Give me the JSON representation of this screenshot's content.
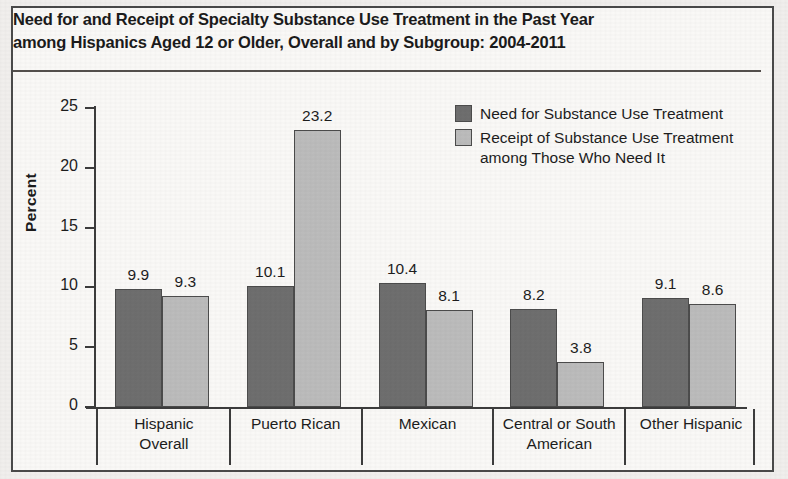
{
  "figure": {
    "title_lines": [
      "Need for and Receipt of Specialty Substance Use Treatment in the Past Year",
      "among Hispanics Aged 12 or Older, Overall and by Subgroup: 2004-2011"
    ]
  },
  "colors": {
    "need": "#6f6f6f",
    "receipt": "#bdbdbd",
    "axis": "#3d3d3d",
    "text": "#1d1d1d",
    "page": "#fbfaf8"
  },
  "chart_data": {
    "type": "bar",
    "title": "Need for and Receipt of Specialty Substance Use Treatment in the Past Year among Hispanics Aged 12 or Older, Overall and by Subgroup: 2004-2011",
    "xlabel": "",
    "ylabel": "Percent",
    "ylim": [
      0,
      25
    ],
    "yticks": [
      0,
      5,
      10,
      15,
      20,
      25
    ],
    "grid": false,
    "legend_position": "upper right",
    "categories": [
      "Hispanic Overall",
      "Puerto Rican",
      "Mexican",
      "Central or South American",
      "Other Hispanic"
    ],
    "category_lines": [
      [
        "Hispanic",
        "Overall"
      ],
      [
        "Puerto Rican"
      ],
      [
        "Mexican"
      ],
      [
        "Central or South",
        "American"
      ],
      [
        "Other Hispanic"
      ]
    ],
    "series": [
      {
        "name": "Need for Substance Use Treatment",
        "color": "#6f6f6f",
        "values": [
          9.9,
          10.1,
          10.4,
          8.2,
          9.1
        ],
        "labels": [
          "9.9",
          "10.1",
          "10.4",
          "8.2",
          "9.1"
        ]
      },
      {
        "name": "Receipt of Substance Use Treatment among Those Who Need It",
        "color": "#bdbdbd",
        "values": [
          9.3,
          23.2,
          8.1,
          3.8,
          8.6
        ],
        "labels": [
          "9.3",
          "23.2",
          "8.1",
          "3.8",
          "8.6"
        ]
      }
    ]
  },
  "legend": {
    "items": [
      {
        "lines": [
          "Need for Substance Use Treatment"
        ],
        "swatch": "need"
      },
      {
        "lines": [
          "Receipt of Substance Use Treatment",
          "among Those Who Need It"
        ],
        "swatch": "receipt"
      }
    ]
  }
}
